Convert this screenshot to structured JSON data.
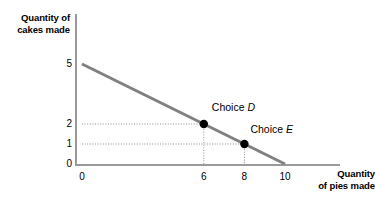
{
  "chart_data": {
    "type": "line",
    "title": "",
    "xlabel": "Quantity\nof pies made",
    "ylabel": "Quantity of\ncakes made",
    "xlim": [
      0,
      13.3
    ],
    "ylim": [
      0,
      7.5
    ],
    "grid": false,
    "legend": null,
    "xticks": [
      {
        "value": 0,
        "label": "0"
      },
      {
        "value": 6,
        "label": "6"
      },
      {
        "value": 8,
        "label": "8"
      },
      {
        "value": 10,
        "label": "10"
      }
    ],
    "yticks": [
      {
        "value": 0,
        "label": "0"
      },
      {
        "value": 1,
        "label": "1"
      },
      {
        "value": 2,
        "label": "2"
      },
      {
        "value": 5,
        "label": "5"
      }
    ],
    "series": [
      {
        "name": "budget-line",
        "type": "line",
        "color": "#808080",
        "width": 3,
        "x": [
          0,
          10
        ],
        "y": [
          5,
          0
        ]
      }
    ],
    "points": [
      {
        "name": "choice-d",
        "label_prefix": "Choice ",
        "label_italic": "D",
        "x": 6,
        "y": 2,
        "color": "#000000",
        "radius": 4.2,
        "label_offset_x": 8,
        "label_offset_y": -22,
        "guides": [
          "horizontal",
          "vertical"
        ]
      },
      {
        "name": "choice-e",
        "label_prefix": "Choice ",
        "label_italic": "E",
        "x": 8,
        "y": 1,
        "color": "#000000",
        "radius": 4.2,
        "label_offset_x": 6,
        "label_offset_y": -20,
        "guides": [
          "horizontal",
          "vertical"
        ]
      }
    ],
    "guide_style": {
      "color": "#8c8c8c",
      "dash": "1,1.6",
      "width": 1
    },
    "axis_color": "#9a9a9a"
  }
}
